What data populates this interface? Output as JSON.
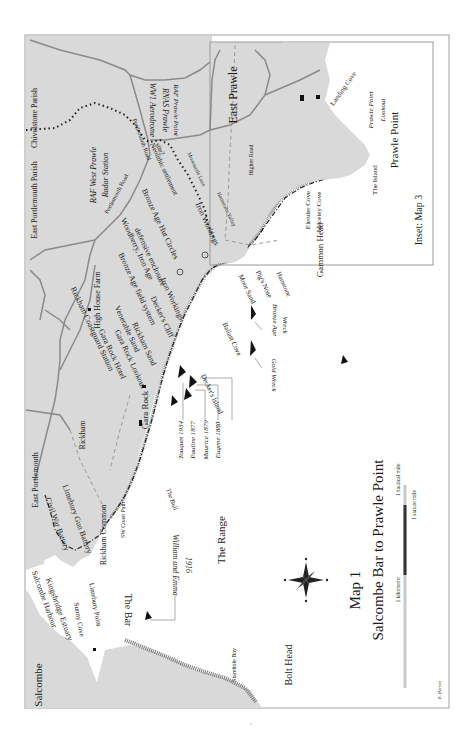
{
  "map": {
    "title": "Map 1",
    "subtitle": "Salcombe Bar to Prawle Point",
    "credit": "R. Barrett",
    "orientation": "rotated 90 degrees; north arrow points left",
    "colors": {
      "land": "#d9d9d9",
      "sea": "#ffffff",
      "frame": "#9a9a9a",
      "roads": "#8a8a8a",
      "text": "#1a1a1a",
      "scale_dark": "#333333",
      "scale_light": "#c8c8c8"
    },
    "inset": {
      "label": "Inset: Map 3"
    },
    "scale_bar": {
      "kilometre": "1 kilometre",
      "statute_mile": "1 statute mile",
      "nautical_mile": "1 nautical mile"
    },
    "compass": {
      "n": "N",
      "s": "S",
      "e": "E",
      "w": "W"
    }
  },
  "labels": {
    "places": {
      "salcombe": "Salcombe",
      "east_prawle": "East Prawle",
      "east_portlemouth": "East Portlemouth",
      "rickham": "Rickham",
      "rickham_common": "Rickham Common",
      "high_house_farm": "High House Farm",
      "gara_rock": "Gara Rock",
      "bolt_head": "Bolt Head",
      "starehole_bay": "Starehole Bay",
      "prawle_point": "Prawle Point",
      "gammon_head": "Gammon Head",
      "the_range": "The Range",
      "the_bar": "The Bar",
      "the_bull": "The Bull",
      "the_island": "The Island",
      "landing_cove": "Landing Cove",
      "elender_cove": "Elender Cove",
      "maceley_cove": "Maceley Cove",
      "moor_sand": "Moor Sand",
      "pigs_nose": "Pig's Nose",
      "ballast_cove": "Ballast Cove",
      "deckers_island": "Decker's Island",
      "hamstone": "Hamstone",
      "chivelstone_parish": "Chivelstone Parish",
      "east_portlemouth_parish": "East Portlemouth Parish",
      "kingsbridge_estuary": "Kingsbridge Estuary",
      "salcombe_harbour": "Salcombe Harbour",
      "sunny_cove": "Sunny Cove",
      "limebury_point": "Limebury Point"
    },
    "sites": {
      "wwi_aerodrome": "WW1 Aerodrome",
      "rnas_prawle": "RNAS Prawle",
      "raf_prawle_point": "RAF Prawle Point",
      "raf_west_prawle": "RAF West Prawle",
      "radar_station": "Radar Station",
      "neolithic_settlement": "Neolithic settlement",
      "site": "site?",
      "bronze_age_hut_circles": "Bronze Age Hut Circles",
      "iron_workings_1": "Iron Workings",
      "woodberry_iron_age": "Woodberry, Iron Age",
      "defensive_enclosure": "defensive enclosure",
      "bronze_age_field_system": "Bronze Age field system",
      "iron_workings_2": "Iron Workings",
      "deckers_cliff": "Decker's Cliff",
      "rickham_sand": "Rickham Sand",
      "venerable_sand": "Venerable Sand",
      "gara_rock_lookout": "Gara Rock Lookout",
      "gara_rock_hotel": "Gara Rock Hotel",
      "rickham_coastguard_station": "Rickham Coastguard Station",
      "limebury_gun_battery": "Limebury Gun Battery",
      "civil_war_battery": "Civil War Battery",
      "sw_coast_path": "SW Coast Path"
    },
    "roads": {
      "portlemouth_road_1": "Portlemouth Road",
      "portlemouth_road_2": "Portlemouth Road",
      "higher_road": "Higher Road",
      "moorsands_lane": "Moorsands Lane",
      "hamstone_valley": "Hamstone Valley"
    },
    "wrecks": {
      "william_and_emma": "William and Emma",
      "william_and_emma_year": "1916",
      "tinqueur": "Touquet 1934",
      "pauline": "Pauline 1877",
      "maurice": "Maurice 1879",
      "eugene": "Eugene 1880",
      "bronze_age_wreck": "Bronze Age",
      "bronze_age_wreck_2": "Wreck",
      "gold_wreck": "Gold Wreck"
    },
    "lookout": {
      "prawle_point_lookout_1": "Prawle Point",
      "prawle_point_lookout_2": "Lookout"
    }
  }
}
